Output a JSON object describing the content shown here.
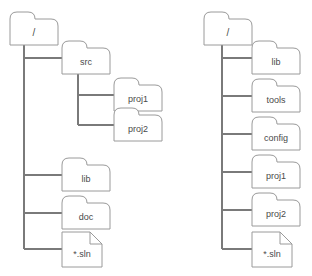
{
  "diagram": {
    "background_color": "#ffffff",
    "node_stroke_color": "#9a9a9a",
    "node_fill_color": "#ffffff",
    "connector_color": "#7a7a7a",
    "label_color": "#4a4a4a",
    "trees": [
      {
        "id": "left-tree",
        "root": {
          "label": "/",
          "icon": "folder-icon",
          "x": 10,
          "y": 12,
          "w": 48,
          "h": 33
        },
        "children": [
          {
            "label": "src",
            "icon": "folder-icon",
            "x": 62,
            "y": 41,
            "w": 48,
            "h": 33,
            "branch_y": 58,
            "children": [
              {
                "label": "proj1",
                "icon": "folder-icon",
                "x": 114,
                "y": 78,
                "w": 48,
                "h": 33,
                "branch_y": 95
              },
              {
                "label": "proj2",
                "icon": "folder-icon",
                "x": 114,
                "y": 108,
                "w": 48,
                "h": 33,
                "branch_y": 125
              }
            ]
          },
          {
            "label": "lib",
            "icon": "folder-icon",
            "x": 62,
            "y": 158,
            "w": 48,
            "h": 33,
            "branch_y": 175
          },
          {
            "label": "doc",
            "icon": "folder-icon",
            "x": 62,
            "y": 196,
            "w": 48,
            "h": 33,
            "branch_y": 213
          },
          {
            "label": "*.sln",
            "icon": "file-icon",
            "x": 62,
            "y": 232,
            "w": 40,
            "h": 35,
            "branch_y": 249
          }
        ]
      },
      {
        "id": "right-tree",
        "root": {
          "label": "/",
          "icon": "folder-icon",
          "x": 204,
          "y": 12,
          "w": 48,
          "h": 33
        },
        "children": [
          {
            "label": "lib",
            "icon": "folder-icon",
            "x": 252,
            "y": 41,
            "w": 48,
            "h": 33,
            "branch_y": 58
          },
          {
            "label": "tools",
            "icon": "folder-icon",
            "x": 252,
            "y": 79,
            "w": 48,
            "h": 33,
            "branch_y": 96
          },
          {
            "label": "config",
            "icon": "folder-icon",
            "x": 252,
            "y": 117,
            "w": 48,
            "h": 33,
            "branch_y": 134
          },
          {
            "label": "proj1",
            "icon": "folder-icon",
            "x": 252,
            "y": 155,
            "w": 48,
            "h": 33,
            "branch_y": 172
          },
          {
            "label": "proj2",
            "icon": "folder-icon",
            "x": 252,
            "y": 193,
            "w": 48,
            "h": 33,
            "branch_y": 210
          },
          {
            "label": "*.sln",
            "icon": "file-icon",
            "x": 252,
            "y": 232,
            "w": 40,
            "h": 35,
            "branch_y": 249
          }
        ]
      }
    ]
  }
}
